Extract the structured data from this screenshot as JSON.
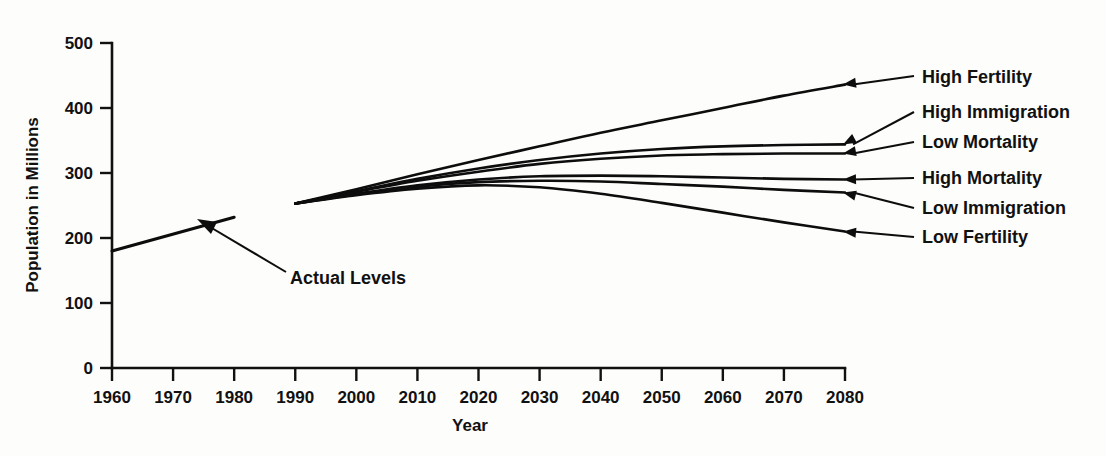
{
  "chart_data": {
    "type": "line",
    "title": "",
    "xlabel": "Year",
    "ylabel": "Population in Millions",
    "xlim": [
      1960,
      2080
    ],
    "ylim": [
      0,
      500
    ],
    "grid": false,
    "legend_position": "right-inline-arrow-labels",
    "x_ticks": [
      1960,
      1970,
      1980,
      1990,
      2000,
      2010,
      2020,
      2030,
      2040,
      2050,
      2060,
      2070,
      2080
    ],
    "y_ticks": [
      0,
      100,
      200,
      300,
      400,
      500
    ],
    "annotations": [
      {
        "text": "Actual Levels",
        "points_to_year": 1977,
        "points_to_value": 213
      }
    ],
    "series": [
      {
        "name": "Actual Levels",
        "kind": "historical",
        "x": [
          1960,
          1980
        ],
        "values": [
          180,
          232
        ]
      },
      {
        "name": "High Fertility",
        "kind": "projection",
        "x": [
          1990,
          2000,
          2010,
          2020,
          2030,
          2040,
          2050,
          2060,
          2070,
          2080
        ],
        "values": [
          253,
          275,
          298,
          320,
          341,
          362,
          381,
          400,
          419,
          436
        ]
      },
      {
        "name": "High Immigration",
        "kind": "projection",
        "x": [
          1990,
          2000,
          2010,
          2020,
          2030,
          2040,
          2050,
          2060,
          2070,
          2080
        ],
        "values": [
          253,
          272,
          291,
          307,
          320,
          330,
          337,
          341,
          343,
          344
        ]
      },
      {
        "name": "Low Mortality",
        "kind": "projection",
        "x": [
          1990,
          2000,
          2010,
          2020,
          2030,
          2040,
          2050,
          2060,
          2070,
          2080
        ],
        "values": [
          253,
          271,
          288,
          302,
          314,
          322,
          327,
          329,
          330,
          330
        ]
      },
      {
        "name": "High Mortality",
        "kind": "projection",
        "x": [
          1990,
          2000,
          2010,
          2020,
          2030,
          2040,
          2050,
          2060,
          2070,
          2080
        ],
        "values": [
          253,
          268,
          281,
          290,
          295,
          296,
          295,
          293,
          291,
          290
        ]
      },
      {
        "name": "Low Immigration",
        "kind": "projection",
        "x": [
          1990,
          2000,
          2010,
          2020,
          2030,
          2040,
          2050,
          2060,
          2070,
          2080
        ],
        "values": [
          253,
          267,
          279,
          286,
          288,
          287,
          283,
          279,
          274,
          270
        ]
      },
      {
        "name": "Low Fertility",
        "kind": "projection",
        "x": [
          1990,
          2000,
          2010,
          2020,
          2030,
          2040,
          2050,
          2060,
          2070,
          2080
        ],
        "values": [
          253,
          266,
          276,
          281,
          278,
          268,
          254,
          239,
          224,
          210
        ]
      }
    ]
  },
  "labels": {
    "series_callouts": [
      "High Fertility",
      "High Immigration",
      "Low Mortality",
      "High Mortality",
      "Low Immigration",
      "Low Fertility"
    ],
    "annotation": "Actual Levels",
    "x_axis_title": "Year",
    "y_axis_title": "Population in Millions",
    "x_tick_labels": [
      "1960",
      "1970",
      "1980",
      "1990",
      "2000",
      "2010",
      "2020",
      "2030",
      "2040",
      "2050",
      "2060",
      "2070",
      "2080"
    ],
    "y_tick_labels": [
      "0",
      "100",
      "200",
      "300",
      "400",
      "500"
    ]
  },
  "colors": {
    "ink": "#0d0d0d",
    "background": "#fdfdfb"
  }
}
